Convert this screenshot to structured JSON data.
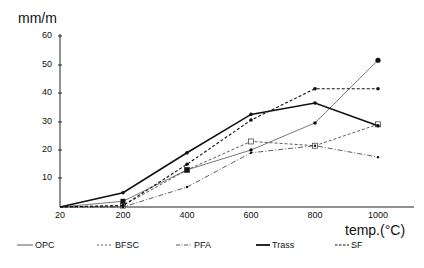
{
  "chart_data": {
    "type": "line",
    "title": "",
    "xlabel": "temp.(°C)",
    "ylabel": "mm/m",
    "x": [
      20,
      200,
      400,
      600,
      800,
      1000
    ],
    "x_tick_labels": [
      "20",
      "200",
      "400",
      "600",
      "800",
      "1000"
    ],
    "y_tick_labels": [
      "10",
      "20",
      "30",
      "40",
      "50",
      "60"
    ],
    "ylim": [
      0,
      60
    ],
    "grid": false,
    "legend_position": "bottom",
    "series": [
      {
        "name": "OPC",
        "style": "thin-solid",
        "marker": "circle",
        "values": [
          0,
          2,
          13,
          20,
          29.5,
          51.5
        ]
      },
      {
        "name": "BFSC",
        "style": "dashed",
        "marker": "open-square",
        "values": [
          0,
          0.5,
          13,
          23,
          21.5,
          29
        ]
      },
      {
        "name": "PFA",
        "style": "dash-dot",
        "marker": "small-dot",
        "values": [
          0,
          0,
          7,
          19,
          21.5,
          17.5
        ]
      },
      {
        "name": "Trass",
        "style": "thick-solid",
        "marker": "dot",
        "values": [
          0,
          5,
          19,
          32.5,
          36.5,
          28.5
        ]
      },
      {
        "name": "SF",
        "style": "thick-dashed",
        "marker": "circle",
        "values": [
          0,
          0.5,
          15,
          30.5,
          41.5,
          41.5
        ]
      }
    ]
  },
  "labels": {
    "ylabel": "mm/m",
    "xlabel": "temp.(°C)",
    "yticks": [
      "60",
      "50",
      "40",
      "30",
      "20",
      "10"
    ],
    "xticks": [
      "20",
      "200",
      "400",
      "600",
      "800",
      "1000"
    ],
    "legend": [
      "OPC",
      "BFSC",
      "PFA",
      "Trass",
      "SF"
    ]
  }
}
